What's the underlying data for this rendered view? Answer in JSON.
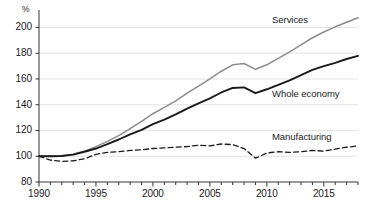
{
  "chart_data": {
    "type": "line",
    "title": "",
    "subtitle": "",
    "xlabel": "",
    "ylabel": "",
    "unit_label": "%",
    "xlim": [
      1990,
      2018
    ],
    "ylim": [
      80,
      212
    ],
    "yticks": [
      80,
      100,
      120,
      140,
      160,
      180,
      200
    ],
    "xticks": [
      1990,
      1995,
      2000,
      2005,
      2010,
      2015
    ],
    "xtick_labels": [
      "1990",
      "1995",
      "2000",
      "2005",
      "2010",
      "2015"
    ],
    "ytick_labels": [
      "80",
      "100",
      "120",
      "140",
      "160",
      "180",
      "200"
    ],
    "minor_xticks_every": 1,
    "grid": "horizontal",
    "legend": "inline-right-of-series",
    "x": [
      1990,
      1991,
      1992,
      1993,
      1994,
      1995,
      1996,
      1997,
      1998,
      1999,
      2000,
      2001,
      2002,
      2003,
      2004,
      2005,
      2006,
      2007,
      2008,
      2009,
      2010,
      2011,
      2012,
      2013,
      2014,
      2015,
      2016,
      2017,
      2018
    ],
    "series": [
      {
        "name": "Services",
        "color": "#8c8c8c",
        "style": "solid",
        "label_year": 2012,
        "values": [
          100.0,
          100.2,
          100.3,
          101.5,
          104.0,
          107.5,
          111.5,
          116.0,
          121.5,
          127.0,
          133.0,
          138.0,
          143.0,
          149.0,
          154.5,
          160.0,
          166.0,
          171.0,
          172.0,
          167.5,
          171.0,
          176.0,
          181.0,
          186.5,
          192.0,
          196.5,
          200.5,
          204.0,
          207.5
        ]
      },
      {
        "name": "Whole economy",
        "color": "#1a1a1a",
        "style": "solid",
        "label_year": 2012,
        "values": [
          100.0,
          100.0,
          100.2,
          101.3,
          103.5,
          106.0,
          109.5,
          113.0,
          117.0,
          120.5,
          125.0,
          128.5,
          132.5,
          137.0,
          141.0,
          145.0,
          149.5,
          153.0,
          153.5,
          149.0,
          152.0,
          155.5,
          159.0,
          163.0,
          167.0,
          170.0,
          172.5,
          175.5,
          178.0
        ]
      },
      {
        "name": "Manufacturing",
        "color": "#1a1a1a",
        "style": "dashed",
        "label_year": 2012,
        "values": [
          100.0,
          97.0,
          96.0,
          96.5,
          98.0,
          101.5,
          103.0,
          103.5,
          104.5,
          105.0,
          106.0,
          106.5,
          107.0,
          107.5,
          108.5,
          108.0,
          109.5,
          109.0,
          106.0,
          98.5,
          102.5,
          103.5,
          103.0,
          103.5,
          104.5,
          104.0,
          105.5,
          107.0,
          108.0
        ]
      }
    ]
  },
  "labels": {
    "services": "Services",
    "whole_economy": "Whole economy",
    "manufacturing": "Manufacturing",
    "unit": "%"
  }
}
